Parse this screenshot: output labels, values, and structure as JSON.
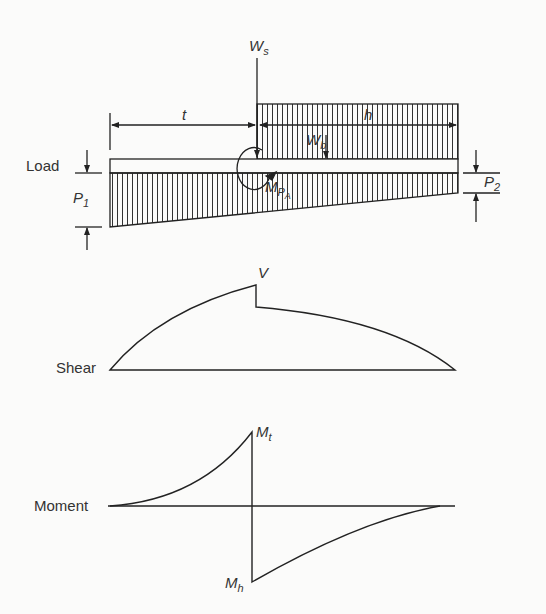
{
  "load": {
    "label": "Load",
    "symbols": {
      "Ws": "W",
      "Ws_sub": "s",
      "Wb": "W",
      "Wb_sub": "b",
      "t": "t",
      "h": "h",
      "P1": "P",
      "P1_sub": "1",
      "P2": "P",
      "P2_sub": "2",
      "MPA": "M",
      "MPA_sub": "P",
      "MPA_subsub": "A"
    }
  },
  "shear": {
    "label": "Shear",
    "peak_label": "V"
  },
  "moment": {
    "label": "Moment",
    "max_label": "M",
    "max_sub": "t",
    "min_label": "M",
    "min_sub": "h"
  }
}
